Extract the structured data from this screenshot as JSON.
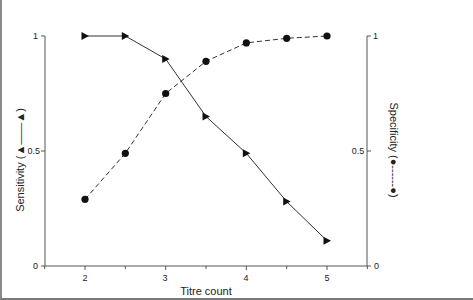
{
  "chart_data": {
    "type": "line",
    "title": "",
    "xlabel": "Titre count",
    "ylabel_left": "Sensitivity",
    "ylabel_right": "Specificity",
    "legend_left_glyph": "(▲——▲)",
    "legend_right_glyph": "(●------●)",
    "x": [
      2,
      2.5,
      3,
      3.5,
      4,
      4.5,
      5
    ],
    "xlim": [
      1.5,
      5.5
    ],
    "xticks_major": [
      2,
      3,
      4,
      5
    ],
    "xticks_minor": [
      1.5,
      2.5,
      3.5,
      4.5,
      5.5
    ],
    "ylim": [
      0,
      1
    ],
    "yticks": [
      0,
      0.5,
      1
    ],
    "ytick_labels": [
      "0",
      "0.5",
      "1"
    ],
    "grid": false,
    "series": [
      {
        "name": "Sensitivity",
        "axis": "left",
        "marker": "triangle-right",
        "line_style": "solid",
        "values": [
          1.0,
          1.0,
          0.9,
          0.65,
          0.49,
          0.28,
          0.11
        ]
      },
      {
        "name": "Specificity",
        "axis": "right",
        "marker": "circle",
        "line_style": "dashed",
        "values": [
          0.29,
          0.49,
          0.75,
          0.89,
          0.97,
          0.99,
          1.0
        ]
      }
    ]
  },
  "labels": {
    "xlabel": "Titre count",
    "left_axis": "Sensitivity (▲——▲)",
    "right_axis": "Specificity (●------●)",
    "xtick_2": "2",
    "xtick_3": "3",
    "xtick_4": "4",
    "xtick_5": "5",
    "ytick_left_0": "0",
    "ytick_left_05": "0.5",
    "ytick_left_1": "1",
    "ytick_right_0": "0",
    "ytick_right_05": "0.5",
    "ytick_right_1": "1"
  },
  "colors": {
    "line": "#333333",
    "marker": "#111111",
    "axis": "#555555"
  }
}
